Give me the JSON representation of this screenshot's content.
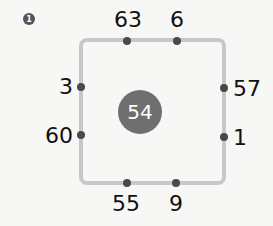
{
  "problem_number": "1",
  "center_value": "54",
  "numbers": {
    "top_left": "63",
    "top_right": "6",
    "left_upper": "3",
    "left_lower": "60",
    "right_upper": "57",
    "right_lower": "1",
    "bottom_left": "55",
    "bottom_right": "9"
  }
}
